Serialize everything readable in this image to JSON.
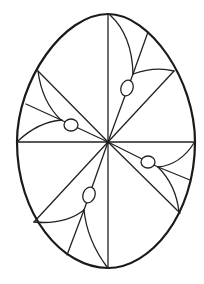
{
  "artwork": {
    "title": "Easter egg coloring page",
    "subject": "egg-outline-with-radial-petal-pattern",
    "colors": {
      "background": "#ffffff",
      "stroke": "#1a1a1a"
    },
    "egg": {
      "cx": 106,
      "top": 14,
      "bottom": 268,
      "left": 17,
      "right": 195,
      "center_y": 142
    },
    "center": {
      "x": 108,
      "y": 142
    },
    "quadrants": [
      {
        "name": "upper-right",
        "oval": {
          "cx": 127,
          "cy": 87,
          "rx": 6,
          "ry": 8,
          "rotate": 20
        }
      },
      {
        "name": "upper-left",
        "oval": {
          "cx": 71,
          "cy": 126,
          "rx": 7,
          "ry": 6,
          "rotate": 0
        }
      },
      {
        "name": "lower-right",
        "oval": {
          "cx": 148,
          "cy": 162,
          "rx": 7,
          "ry": 6,
          "rotate": 0
        }
      },
      {
        "name": "lower-left",
        "oval": {
          "cx": 89,
          "cy": 195,
          "rx": 6,
          "ry": 8,
          "rotate": 20
        }
      }
    ]
  }
}
